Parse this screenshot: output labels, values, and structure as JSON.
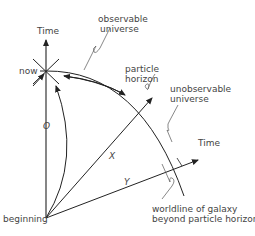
{
  "diagram": {
    "labels": {
      "time_top": "Time",
      "now": "now",
      "observable_1": "observable",
      "observable_2": "universe",
      "particle_1": "particle",
      "particle_2": "horizon",
      "unobservable_1": "unobservable",
      "unobservable_2": "universe",
      "time_right": "Time",
      "worldline_1": "worldline of galaxy",
      "worldline_2": "beyond particle horizon",
      "beginning": "beginning",
      "axis_o": "O",
      "axis_x": "X",
      "axis_y": "Y"
    },
    "colors": {
      "line": "#222222",
      "text": "#444444"
    }
  }
}
